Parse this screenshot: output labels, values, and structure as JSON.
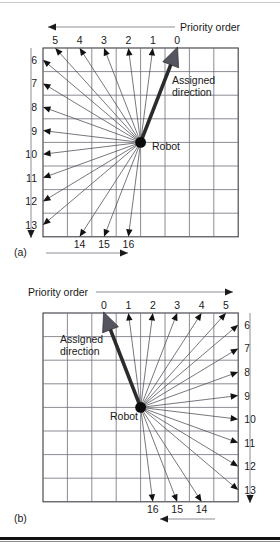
{
  "figure": {
    "caption_a": "(a)",
    "caption_b": "(b)",
    "priority_label": "Priority order",
    "assigned_label_line1": "Assigned",
    "assigned_label_line2": "direction",
    "robot_label": "Robot"
  },
  "chart_data": {
    "type": "diagram",
    "panels": [
      {
        "id": "a",
        "caption": "(a)",
        "priority_axis_label": "Priority order",
        "priority_axis_direction": "right-to-left",
        "top_ticks": [
          "5",
          "4",
          "3",
          "2",
          "1",
          "0"
        ],
        "left_ticks": [
          "6",
          "7",
          "8",
          "9",
          "10",
          "11",
          "12",
          "13"
        ],
        "bottom_ticks": [
          "14",
          "15",
          "16"
        ],
        "bottom_axis_direction": "left-to-right",
        "left_axis_direction": "downward",
        "robot_label": "Robot",
        "assigned_direction_label": "Assigned direction",
        "assigned_direction_priority": "0",
        "grid_cols": 8,
        "grid_rows": 8,
        "robot_cell": {
          "col": 4,
          "row": 4
        },
        "rays": [
          {
            "priority": "0",
            "endpoint": "top",
            "index": 5
          },
          {
            "priority": "1",
            "endpoint": "top",
            "index": 4
          },
          {
            "priority": "2",
            "endpoint": "top",
            "index": 3
          },
          {
            "priority": "3",
            "endpoint": "top",
            "index": 2
          },
          {
            "priority": "4",
            "endpoint": "top",
            "index": 1
          },
          {
            "priority": "5",
            "endpoint": "top",
            "index": 0
          },
          {
            "priority": "6",
            "endpoint": "left",
            "index": 0
          },
          {
            "priority": "7",
            "endpoint": "left",
            "index": 1
          },
          {
            "priority": "8",
            "endpoint": "left",
            "index": 2
          },
          {
            "priority": "9",
            "endpoint": "left",
            "index": 3
          },
          {
            "priority": "10",
            "endpoint": "left",
            "index": 4
          },
          {
            "priority": "11",
            "endpoint": "left",
            "index": 5
          },
          {
            "priority": "12",
            "endpoint": "left",
            "index": 6
          },
          {
            "priority": "13",
            "endpoint": "left",
            "index": 7
          },
          {
            "priority": "14",
            "endpoint": "bottom",
            "index": 1
          },
          {
            "priority": "15",
            "endpoint": "bottom",
            "index": 2
          },
          {
            "priority": "16",
            "endpoint": "bottom",
            "index": 3
          }
        ]
      },
      {
        "id": "b",
        "caption": "(b)",
        "priority_axis_label": "Priority order",
        "priority_axis_direction": "left-to-right",
        "top_ticks": [
          "0",
          "1",
          "2",
          "3",
          "4",
          "5"
        ],
        "right_ticks": [
          "6",
          "7",
          "8",
          "9",
          "10",
          "11",
          "12",
          "13"
        ],
        "bottom_ticks": [
          "16",
          "15",
          "14"
        ],
        "bottom_axis_direction": "right-to-left",
        "right_axis_direction": "downward",
        "robot_label": "Robot",
        "assigned_direction_label": "Assigned direction",
        "assigned_direction_priority": "0",
        "grid_cols": 8,
        "grid_rows": 8,
        "robot_cell": {
          "col": 4,
          "row": 4
        },
        "rays": [
          {
            "priority": "0",
            "endpoint": "top",
            "index": 2
          },
          {
            "priority": "1",
            "endpoint": "top",
            "index": 3
          },
          {
            "priority": "2",
            "endpoint": "top",
            "index": 4
          },
          {
            "priority": "3",
            "endpoint": "top",
            "index": 5
          },
          {
            "priority": "4",
            "endpoint": "top",
            "index": 6
          },
          {
            "priority": "5",
            "endpoint": "top",
            "index": 7
          },
          {
            "priority": "6",
            "endpoint": "right",
            "index": 0
          },
          {
            "priority": "7",
            "endpoint": "right",
            "index": 1
          },
          {
            "priority": "8",
            "endpoint": "right",
            "index": 2
          },
          {
            "priority": "9",
            "endpoint": "right",
            "index": 3
          },
          {
            "priority": "10",
            "endpoint": "right",
            "index": 4
          },
          {
            "priority": "11",
            "endpoint": "right",
            "index": 5
          },
          {
            "priority": "12",
            "endpoint": "right",
            "index": 6
          },
          {
            "priority": "13",
            "endpoint": "right",
            "index": 7
          },
          {
            "priority": "14",
            "endpoint": "bottom",
            "index": 6
          },
          {
            "priority": "15",
            "endpoint": "bottom",
            "index": 5
          },
          {
            "priority": "16",
            "endpoint": "bottom",
            "index": 4
          }
        ]
      }
    ],
    "colors": {
      "grid": "#6e6e78",
      "frame": "#3c3c44",
      "ray": "#4a4a52",
      "assigned_fill": "#555560",
      "assigned_stroke": "#2b2b2b",
      "robot": "#0b0b0b",
      "text": "#1a1a1a",
      "background": "#ffffff"
    }
  }
}
